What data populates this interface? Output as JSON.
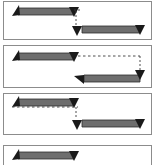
{
  "figure": {
    "title": "",
    "panel_count": 4,
    "background_color": "#ffffff",
    "panel_border_color": "#8c8c8c",
    "bar_fill_color": "#6e6e6e",
    "bar_edge_color": "#2b2b2b",
    "arrowhead_color": "#1a1a1a",
    "dashed_line_color": "#3a3a3a",
    "panels": [
      {
        "id": "panel-1",
        "label": "",
        "bars": [
          {
            "name": "upper-left-bar",
            "x": 8,
            "y": 6,
            "width": 62,
            "height": 7,
            "start_head": "up-left-triangle",
            "end_head": "down-triangle"
          },
          {
            "name": "lower-right-bar",
            "x": 76,
            "y": 24,
            "width": 64,
            "height": 7,
            "start_head": "up-left-triangle",
            "end_head": "down-triangle"
          }
        ],
        "connector": {
          "name": "vertical-dashed-connector",
          "style": "dashed",
          "from_x": 73,
          "from_y": 13,
          "to_x": 73,
          "to_y": 24,
          "orientation": "vertical"
        }
      },
      {
        "id": "panel-2",
        "label": "",
        "bars": [
          {
            "name": "upper-left-bar",
            "x": 8,
            "y": 7,
            "width": 62,
            "height": 7,
            "start_head": "up-left-triangle",
            "end_head": "down-triangle"
          },
          {
            "name": "lower-right-bar",
            "x": 76,
            "y": 28,
            "width": 64,
            "height": 7,
            "start_head": "up-left-triangle",
            "end_head": "down-triangle"
          }
        ],
        "connector": {
          "name": "horizontal-then-vertical-dashed-connector",
          "style": "dashed",
          "from_x": 72,
          "from_y": 11,
          "to_x": 137,
          "to_y": 28,
          "orientation": "elbow-right-down"
        }
      },
      {
        "id": "panel-3",
        "label": "",
        "bars": [
          {
            "name": "upper-left-bar",
            "x": 8,
            "y": 5,
            "width": 62,
            "height": 7,
            "start_head": "up-left-triangle",
            "end_head": "down-triangle"
          },
          {
            "name": "lower-right-bar",
            "x": 76,
            "y": 26,
            "width": 64,
            "height": 7,
            "start_head": "up-left-triangle",
            "end_head": "down-triangle"
          }
        ],
        "connector": {
          "name": "underline-then-vertical-dashed-connector",
          "style": "dashed",
          "from_x": 8,
          "from_y": 13,
          "to_x": 73,
          "to_y": 26,
          "orientation": "elbow-right-down"
        }
      },
      {
        "id": "panel-4",
        "label": "",
        "clipped": true,
        "bars": [
          {
            "name": "upper-left-bar",
            "x": 8,
            "y": 7,
            "width": 62,
            "height": 7,
            "start_head": "up-left-triangle",
            "end_head": "down-triangle"
          }
        ],
        "connector": null
      }
    ]
  }
}
